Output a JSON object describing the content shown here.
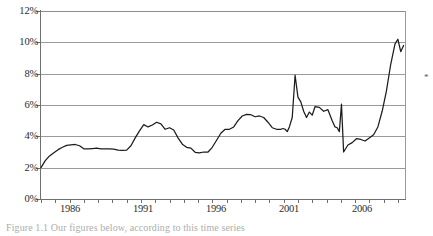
{
  "figure": {
    "margin_mark": "*",
    "caption": "Figure 1.1    Our figures below, according to this time series"
  },
  "chart_data": {
    "type": "line",
    "title": "",
    "subtitle": "",
    "xlabel": "",
    "ylabel": "",
    "grid": "horizontal",
    "legend": "none",
    "xlim": [
      1984.0,
      2009.5
    ],
    "ylim": [
      0,
      12
    ],
    "ytick_labels": [
      "0%",
      "2%",
      "4%",
      "6%",
      "8%",
      "10%",
      "12%"
    ],
    "ytick_values": [
      0,
      2,
      4,
      6,
      8,
      10,
      12
    ],
    "xtick_labels": [
      "1986",
      "1991",
      "1996",
      "2001",
      "2006"
    ],
    "xtick_values": [
      1986,
      1991,
      1996,
      2001,
      2006
    ],
    "xtick_minor_interval": 1,
    "units": "percent",
    "series": [
      {
        "name": "rate",
        "x": [
          1984.0,
          1984.3,
          1984.6,
          1984.9,
          1985.2,
          1985.5,
          1985.8,
          1986.1,
          1986.4,
          1986.7,
          1987.0,
          1987.3,
          1987.6,
          1987.9,
          1988.2,
          1988.5,
          1988.8,
          1989.1,
          1989.4,
          1989.7,
          1990.0,
          1990.3,
          1990.6,
          1990.9,
          1991.2,
          1991.5,
          1991.8,
          1992.1,
          1992.4,
          1992.7,
          1993.0,
          1993.3,
          1993.6,
          1993.9,
          1994.2,
          1994.5,
          1994.8,
          1995.1,
          1995.4,
          1995.7,
          1996.0,
          1996.3,
          1996.6,
          1996.9,
          1997.2,
          1997.5,
          1997.8,
          1998.1,
          1998.4,
          1998.7,
          1999.0,
          1999.3,
          1999.6,
          1999.9,
          2000.2,
          2000.5,
          2000.8,
          2000.95,
          2001.1,
          2001.25,
          2001.4,
          2001.6,
          2001.8,
          2002.0,
          2002.2,
          2002.4,
          2002.6,
          2002.8,
          2003.0,
          2003.2,
          2003.5,
          2003.8,
          2004.1,
          2004.4,
          2004.6,
          2004.75,
          2004.9,
          2005.05,
          2005.2,
          2005.5,
          2005.8,
          2006.1,
          2006.4,
          2006.7,
          2007.0,
          2007.3,
          2007.6,
          2007.9,
          2008.2,
          2008.5,
          2008.8,
          2009.0,
          2009.2,
          2009.4
        ],
        "values": [
          2.0,
          2.45,
          2.75,
          2.95,
          3.15,
          3.3,
          3.42,
          3.46,
          3.48,
          3.4,
          3.2,
          3.2,
          3.22,
          3.24,
          3.2,
          3.2,
          3.2,
          3.18,
          3.12,
          3.1,
          3.12,
          3.4,
          3.9,
          4.35,
          4.75,
          4.6,
          4.72,
          4.9,
          4.8,
          4.45,
          4.55,
          4.4,
          3.9,
          3.5,
          3.3,
          3.25,
          2.98,
          2.95,
          3.0,
          3.0,
          3.3,
          3.75,
          4.2,
          4.45,
          4.45,
          4.6,
          5.0,
          5.3,
          5.4,
          5.38,
          5.25,
          5.3,
          5.2,
          4.9,
          4.55,
          4.45,
          4.45,
          4.5,
          4.45,
          4.3,
          4.6,
          5.2,
          7.9,
          6.5,
          6.2,
          5.6,
          5.2,
          5.55,
          5.35,
          5.9,
          5.85,
          5.6,
          5.7,
          5.0,
          4.6,
          4.55,
          4.3,
          6.05,
          3.0,
          3.45,
          3.6,
          3.85,
          3.8,
          3.7,
          3.9,
          4.1,
          4.6,
          5.6,
          6.9,
          8.6,
          9.9,
          10.2,
          9.4,
          9.8
        ]
      }
    ]
  }
}
